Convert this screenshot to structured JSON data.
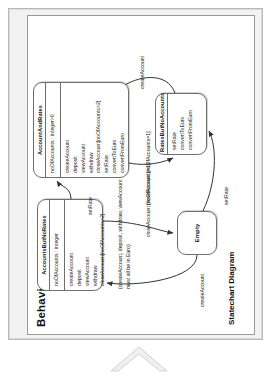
{
  "slide": {
    "title": "Behavioral Model",
    "diagram_label": "Statechart Diagram",
    "note": "(createAccount, deposit, withdraw, viewAccount must all be in Euro)"
  },
  "states": {
    "accountsbutnorates": {
      "name": "AccountsButNoRates",
      "attributes": [
        "noOfAccounts : integer"
      ],
      "operations": [
        "createAccount",
        "deposit",
        "viewAccount",
        "withdraw",
        "closeAccount[noOfAccounts>2]"
      ]
    },
    "accountandrates": {
      "name": "AccountAndRates",
      "attributes": [
        "noOfAccounts : integer>0"
      ],
      "operations": [
        "createAccount",
        "deposit",
        "viewAccount",
        "withdraw",
        "closeAccount[noOfAccounts>2]",
        "setRate",
        "convertToEuro",
        "convertFromEuro"
      ]
    },
    "ratesbutnoaccounts": {
      "name": "RatesButNoAccounts",
      "operations": [
        "setRate",
        "convertToEuro",
        "convertFromEuro"
      ]
    },
    "empty": {
      "name": "Empty"
    }
  },
  "transitions": {
    "setrate_left": "setRate",
    "setrate_bottom": "setRate",
    "createaccount_left": "createAccount",
    "createaccount_right": "createAccount",
    "closeaccount_guard_1": "closeAccount\n[noOfAccounts=1]",
    "closeaccount_guard_2": "closeAccount\n[noOfAccounts=1]"
  },
  "colors": {
    "stroke": "#6e6e6e",
    "slide_bg": "#f2f2f2",
    "canvas_bg": "#ffffff",
    "chevron": "#efefef"
  }
}
